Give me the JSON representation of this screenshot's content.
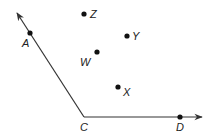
{
  "diagram": {
    "type": "geometry-angle",
    "colors": {
      "line": "#333333",
      "point": "#111111",
      "background": "#ffffff"
    },
    "vertex": {
      "name": "C",
      "x": 84,
      "y": 117,
      "label": "C",
      "label_x": 80,
      "label_y": 131
    },
    "rays": [
      {
        "name": "ray-CA",
        "from": "C",
        "through": "A",
        "tip_x": 17,
        "tip_y": 13
      },
      {
        "name": "ray-CD",
        "from": "C",
        "through": "D",
        "tip_x": 202,
        "tip_y": 117
      }
    ],
    "points": [
      {
        "name": "A",
        "x": 30,
        "y": 33,
        "label": "A",
        "label_x": 22,
        "label_y": 47
      },
      {
        "name": "D",
        "x": 180,
        "y": 117,
        "label": "D",
        "label_x": 176,
        "label_y": 131
      },
      {
        "name": "Z",
        "x": 84,
        "y": 14,
        "label": "Z",
        "label_x": 90,
        "label_y": 18
      },
      {
        "name": "Y",
        "x": 127,
        "y": 36,
        "label": "Y",
        "label_x": 132,
        "label_y": 40
      },
      {
        "name": "W",
        "x": 97,
        "y": 52,
        "label": "W",
        "label_x": 80,
        "label_y": 66
      },
      {
        "name": "X",
        "x": 118,
        "y": 87,
        "label": "X",
        "label_x": 123,
        "label_y": 96
      }
    ]
  }
}
